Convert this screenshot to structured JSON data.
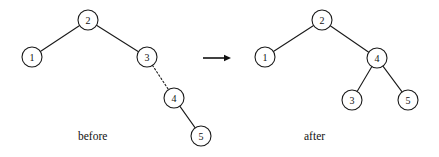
{
  "figure": {
    "width": 439,
    "height": 157,
    "background_color": "#ffffff",
    "stroke_color": "#1a1a1a",
    "text_color": "#111111"
  },
  "captions": {
    "before": "before",
    "after": "after"
  },
  "transition_arrow": {
    "name": "rightwards-arrow",
    "glyph": "→",
    "x1": 203,
    "x2": 231,
    "y": 58
  },
  "before_tree": {
    "label": "before",
    "root": "2",
    "node_radius": 10,
    "nodes": [
      {
        "id": "n2",
        "label": "2",
        "cx": 88,
        "cy": 20
      },
      {
        "id": "n1",
        "label": "1",
        "cx": 32,
        "cy": 57
      },
      {
        "id": "n3",
        "label": "3",
        "cx": 147,
        "cy": 57
      },
      {
        "id": "n4",
        "label": "4",
        "cx": 174,
        "cy": 98
      },
      {
        "id": "n5",
        "label": "5",
        "cx": 201,
        "cy": 136
      }
    ],
    "edges": [
      {
        "from": "n2",
        "to": "n1",
        "style": "solid"
      },
      {
        "from": "n2",
        "to": "n3",
        "style": "solid"
      },
      {
        "from": "n3",
        "to": "n4",
        "style": "dotted"
      },
      {
        "from": "n4",
        "to": "n5",
        "style": "solid"
      }
    ]
  },
  "after_tree": {
    "label": "after",
    "root": "2",
    "node_radius": 10,
    "nodes": [
      {
        "id": "a2",
        "label": "2",
        "cx": 322,
        "cy": 20
      },
      {
        "id": "a1",
        "label": "1",
        "cx": 265,
        "cy": 57
      },
      {
        "id": "a4",
        "label": "4",
        "cx": 377,
        "cy": 58
      },
      {
        "id": "a3",
        "label": "3",
        "cx": 352,
        "cy": 100
      },
      {
        "id": "a5",
        "label": "5",
        "cx": 408,
        "cy": 100
      }
    ],
    "edges": [
      {
        "from": "a2",
        "to": "a1",
        "style": "solid"
      },
      {
        "from": "a2",
        "to": "a4",
        "style": "solid"
      },
      {
        "from": "a4",
        "to": "a3",
        "style": "solid"
      },
      {
        "from": "a4",
        "to": "a5",
        "style": "solid"
      }
    ]
  }
}
